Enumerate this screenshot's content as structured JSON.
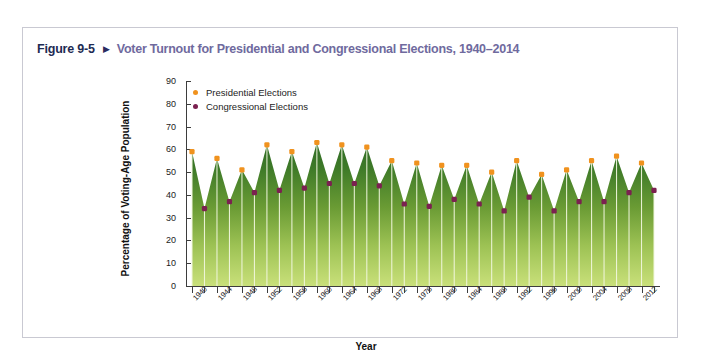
{
  "figure": {
    "number": "Figure 9-5",
    "arrow_icon": "triangle-right-icon",
    "title": "Voter Turnout for Presidential and Congressional Elections, 1940–2014"
  },
  "colors": {
    "figure_number": "#1d2b53",
    "title": "#6f6a9e",
    "presidential_marker": "#f0921e",
    "congressional_marker": "#7b2150",
    "area_top": "#2f6b26",
    "area_bottom": "#c5dd72",
    "axis": "#3d3d3d",
    "card_border": "#c9c9d2"
  },
  "chart_data": {
    "type": "area",
    "title": "Voter Turnout for Presidential and Congressional Elections, 1940–2014",
    "xlabel": "Year",
    "ylabel": "Percentage of Voting-Age Population",
    "ylim": [
      0,
      90
    ],
    "ytick_values": [
      0,
      10,
      20,
      30,
      40,
      50,
      60,
      70,
      80,
      90
    ],
    "ytick_labels": [
      "0",
      "10",
      "20",
      "30",
      "40",
      "50",
      "60",
      "70",
      "80",
      "90"
    ],
    "xlim": [
      1940,
      2014
    ],
    "xtick_labels": [
      "1940",
      "1944",
      "1948",
      "1952",
      "1956",
      "1960",
      "1964",
      "1968",
      "1972",
      "1976",
      "1980",
      "1984",
      "1988",
      "1992",
      "1996",
      "2000",
      "2004",
      "2008",
      "2012"
    ],
    "grid": false,
    "legend_position": "upper-left",
    "legend": [
      {
        "name": "Presidential Elections",
        "marker": "dot",
        "color": "#f0921e"
      },
      {
        "name": "Congressional Elections",
        "marker": "dot",
        "color": "#7b2150"
      }
    ],
    "x": [
      1940,
      1942,
      1944,
      1946,
      1948,
      1950,
      1952,
      1954,
      1956,
      1958,
      1960,
      1962,
      1964,
      1966,
      1968,
      1970,
      1972,
      1974,
      1976,
      1978,
      1980,
      1982,
      1984,
      1986,
      1988,
      1990,
      1992,
      1994,
      1996,
      1998,
      2000,
      2002,
      2004,
      2006,
      2008,
      2010,
      2012,
      2014
    ],
    "values": [
      59,
      34,
      56,
      37,
      51,
      41,
      62,
      42,
      59,
      43,
      63,
      45,
      62,
      45,
      61,
      44,
      55,
      36,
      54,
      35,
      53,
      38,
      53,
      36,
      50,
      33,
      55,
      39,
      49,
      33,
      51,
      37,
      55,
      37,
      57,
      41,
      54,
      42
    ],
    "series": [
      {
        "name": "Presidential Elections",
        "color": "#f0921e",
        "x": [
          1940,
          1944,
          1948,
          1952,
          1956,
          1960,
          1964,
          1968,
          1972,
          1976,
          1980,
          1984,
          1988,
          1992,
          1996,
          2000,
          2004,
          2008,
          2012
        ],
        "values": [
          59,
          56,
          51,
          62,
          59,
          63,
          62,
          61,
          55,
          54,
          53,
          53,
          50,
          55,
          49,
          51,
          55,
          57,
          54
        ]
      },
      {
        "name": "Congressional Elections",
        "color": "#7b2150",
        "x": [
          1942,
          1946,
          1950,
          1954,
          1958,
          1962,
          1966,
          1970,
          1974,
          1978,
          1982,
          1986,
          1990,
          1994,
          1998,
          2002,
          2006,
          2010,
          2014
        ],
        "values": [
          34,
          37,
          41,
          42,
          43,
          45,
          45,
          44,
          36,
          35,
          38,
          36,
          33,
          39,
          33,
          37,
          37,
          41,
          42
        ]
      }
    ]
  }
}
